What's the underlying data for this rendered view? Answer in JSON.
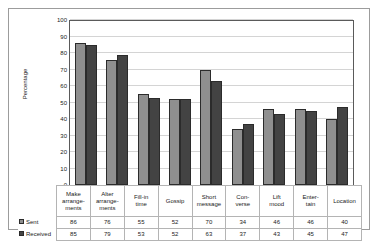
{
  "chart_data": {
    "type": "bar",
    "title": "",
    "xlabel": "",
    "ylabel": "Percentage",
    "ylim": [
      0,
      100
    ],
    "ytick_step": 10,
    "yticks": [
      100,
      90,
      80,
      70,
      60,
      50,
      40,
      30,
      20,
      10,
      0
    ],
    "grid": true,
    "legend_position": "data-table-left",
    "categories": [
      "Make arrange-ments",
      "Alter arrange-ments",
      "Fill-in time",
      "Gossip",
      "Short message",
      "Con-verse",
      "Lift mood",
      "Enter-tain",
      "Location"
    ],
    "category_lines": [
      [
        "Make",
        "arrange-",
        "ments"
      ],
      [
        "Alter",
        "arrange-",
        "ments"
      ],
      [
        "Fill-in",
        "time"
      ],
      [
        "Gossip"
      ],
      [
        "Short",
        "message"
      ],
      [
        "Con-",
        "verse"
      ],
      [
        "Lift",
        "mood"
      ],
      [
        "Enter-",
        "tain"
      ],
      [
        "Location"
      ]
    ],
    "series": [
      {
        "name": "Sent",
        "color": "#8f8f8f",
        "values": [
          86,
          76,
          55,
          52,
          70,
          34,
          46,
          46,
          40
        ]
      },
      {
        "name": "Received",
        "color": "#434343",
        "values": [
          85,
          79,
          53,
          52,
          63,
          37,
          43,
          45,
          47
        ]
      }
    ]
  }
}
